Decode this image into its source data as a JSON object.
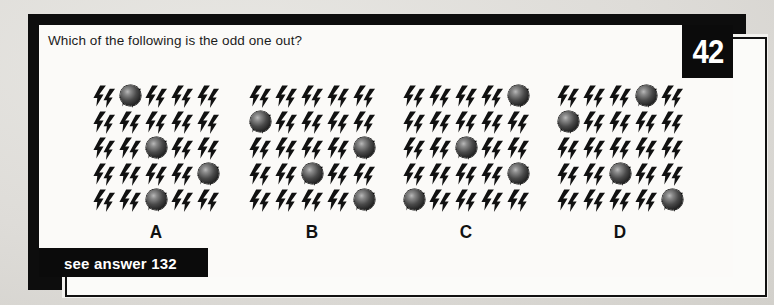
{
  "page": {
    "question": "Which of the following is the odd one out?",
    "number_badge": "42",
    "answer_banner": "see answer 132",
    "colors": {
      "paper": "#dedcd8",
      "card": "#fbfaf8",
      "ink": "#0b0b0b",
      "badge_text": "#ffffff",
      "sphere": "#232323"
    }
  },
  "puzzle": {
    "type": "odd-one-out",
    "grid_cols": 5,
    "grid_rows": 5,
    "glyph": "lightning-bolt",
    "spheres_per_panel": 4,
    "panels": [
      {
        "label": "A",
        "spheres": [
          {
            "col": 1,
            "row": 0
          },
          {
            "col": 2,
            "row": 2
          },
          {
            "col": 4,
            "row": 3
          },
          {
            "col": 2,
            "row": 4
          }
        ]
      },
      {
        "label": "B",
        "spheres": [
          {
            "col": 0,
            "row": 1
          },
          {
            "col": 4,
            "row": 2
          },
          {
            "col": 2,
            "row": 3
          },
          {
            "col": 4,
            "row": 4
          }
        ]
      },
      {
        "label": "C",
        "spheres": [
          {
            "col": 4,
            "row": 0
          },
          {
            "col": 2,
            "row": 2
          },
          {
            "col": 4,
            "row": 3
          },
          {
            "col": 0,
            "row": 4
          }
        ]
      },
      {
        "label": "D",
        "spheres": [
          {
            "col": 3,
            "row": 0
          },
          {
            "col": 0,
            "row": 1
          },
          {
            "col": 2,
            "row": 3
          },
          {
            "col": 4,
            "row": 4
          }
        ]
      }
    ]
  }
}
